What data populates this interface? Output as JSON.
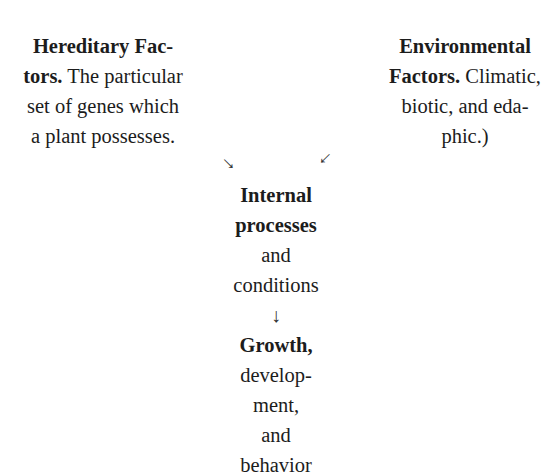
{
  "diagram": {
    "hereditary": {
      "title": "Hereditary Fac-",
      "line2_bold": "tors.",
      "line2_rest": " The particular",
      "line3": "set of genes which",
      "line4": "a plant possesses."
    },
    "environmental": {
      "title": "Environmental",
      "line2_bold": "Factors.",
      "line2_rest": " Climatic,",
      "line3": "biotic, and eda-",
      "line4": "phic.)"
    },
    "arrows": {
      "left": "→",
      "right": "→",
      "down": "↓"
    },
    "internal": {
      "line1": "Internal",
      "line2": "processes",
      "line3": "and",
      "line4": "conditions"
    },
    "outcome": {
      "line1": "Growth,",
      "line2": "develop-",
      "line3": "ment,",
      "line4": "and",
      "line5": "behavior"
    }
  }
}
